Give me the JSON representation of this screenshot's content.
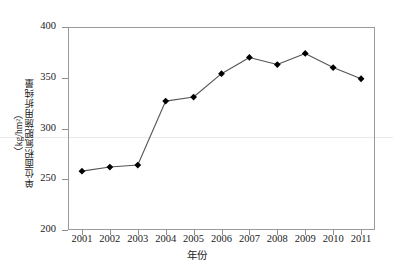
{
  "chart_data": {
    "type": "line",
    "title": "",
    "xlabel": "年份",
    "ylabel": "单位面积氮肥施用折纯量（kg/hm²）",
    "ylabel_main": "单位面积氮肥施用折纯量",
    "ylabel_unit": "（kg/hm²）",
    "categories": [
      "2001",
      "2002",
      "2003",
      "2004",
      "2005",
      "2006",
      "2007",
      "2008",
      "2009",
      "2010",
      "2011"
    ],
    "x": [
      2001,
      2002,
      2003,
      2004,
      2005,
      2006,
      2007,
      2008,
      2009,
      2010,
      2011
    ],
    "values": [
      258,
      262,
      264,
      327,
      331,
      354,
      370,
      363,
      374,
      360,
      349
    ],
    "series": [
      {
        "name": "单位面积氮肥施用折纯量",
        "values": [
          258,
          262,
          264,
          327,
          331,
          354,
          370,
          363,
          374,
          360,
          349
        ]
      }
    ],
    "ylim": [
      200,
      400
    ],
    "ytick_labels": [
      "200",
      "250",
      "300",
      "350",
      "400"
    ],
    "yticks": [
      200,
      250,
      300,
      350,
      400
    ],
    "xlim": [
      2000.5,
      2011.5
    ],
    "grid": false,
    "legend": null,
    "legend_position": "none",
    "marker": "diamond",
    "marker_color": "#000000",
    "line_color": "#555555",
    "axis_color": "#8d8d8d",
    "background": "#ffffff"
  },
  "axes": {
    "y_title_main": "单位面积氮肥施用折纯量",
    "y_title_unit": "（kg/hm²）",
    "x_title": "年份"
  }
}
